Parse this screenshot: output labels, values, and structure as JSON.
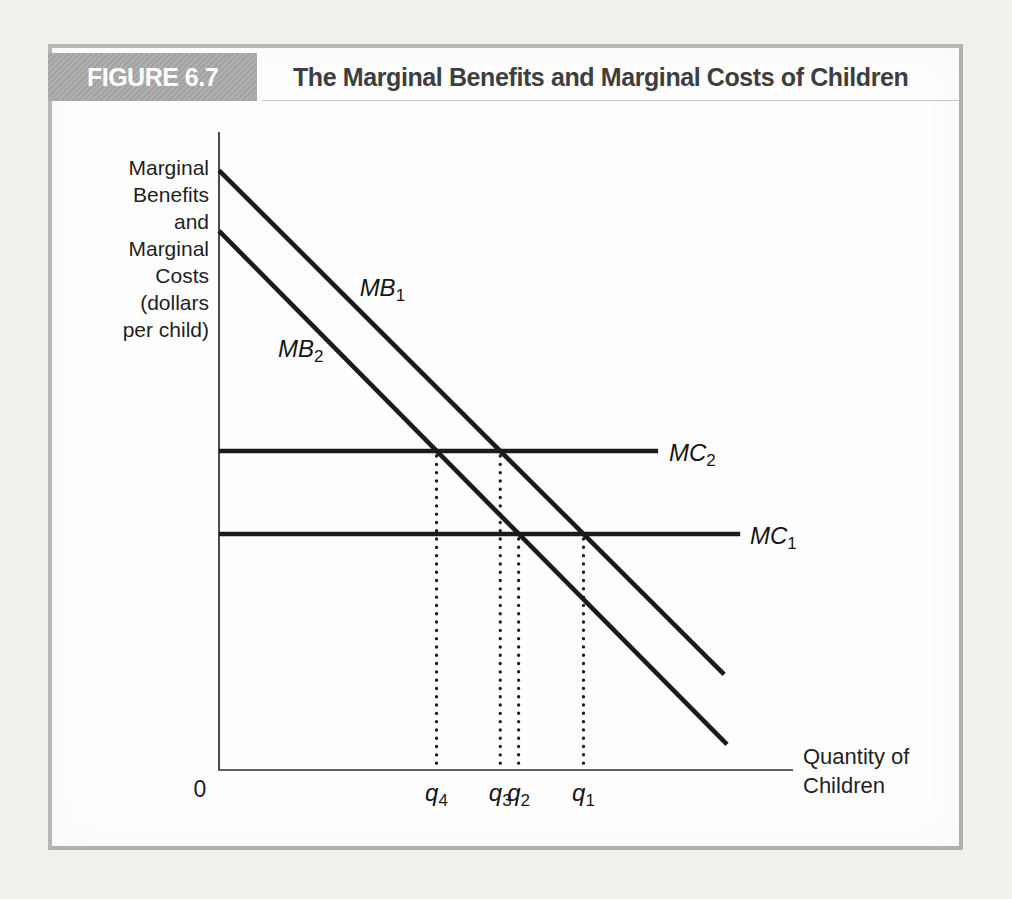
{
  "figure": {
    "tag": "FIGURE 6.7",
    "title": "The Marginal Benefits and Marginal Costs of Children",
    "tag_bg": "#a7a7a7",
    "tag_color": "#ffffff",
    "frame_border": "#b7b7b7"
  },
  "chart_data": {
    "type": "line",
    "title": "The Marginal Benefits and Marginal Costs of Children",
    "xlabel": "Quantity of Children",
    "ylabel": "Marginal Benefits and Marginal Costs (dollars per child)",
    "xlabel_lines": [
      "Quantity of",
      "Children"
    ],
    "ylabel_lines": [
      "Marginal",
      "Benefits",
      "and",
      "Marginal",
      "Costs",
      "(dollars",
      "per child)"
    ],
    "origin_label": "0",
    "xlim": [
      0,
      10
    ],
    "ylim": [
      0,
      10
    ],
    "grid": false,
    "axes_numeric": false,
    "line_color": "#1b1b1b",
    "axis_color": "#2b2b2b",
    "series": [
      {
        "name": "MB1",
        "label_main": "MB",
        "label_sub": "1",
        "points": [
          [
            0,
            9.4
          ],
          [
            8.8,
            1.5
          ]
        ],
        "label_at": [
          2.45,
          7.55
        ]
      },
      {
        "name": "MB2",
        "label_main": "MB",
        "label_sub": "2",
        "points": [
          [
            0,
            8.45
          ],
          [
            8.85,
            0.4
          ]
        ],
        "label_at": [
          1.03,
          6.6
        ]
      },
      {
        "name": "MC2",
        "label_main": "MC",
        "label_sub": "2",
        "points": [
          [
            0,
            5.0
          ],
          [
            7.65,
            5.0
          ]
        ],
        "label_at": [
          7.84,
          4.97
        ]
      },
      {
        "name": "MC1",
        "label_main": "MC",
        "label_sub": "1",
        "points": [
          [
            0,
            3.7
          ],
          [
            9.08,
            3.7
          ]
        ],
        "label_at": [
          9.25,
          3.67
        ]
      }
    ],
    "markers": [
      {
        "name": "q4",
        "label_main": "q",
        "label_sub": "4",
        "x": 3.79,
        "top_y": 5.0,
        "meaning": "MB2 = MC2"
      },
      {
        "name": "q3",
        "label_main": "q",
        "label_sub": "3",
        "x": 4.9,
        "top_y": 5.0,
        "meaning": "MB1 = MC2"
      },
      {
        "name": "q2",
        "label_main": "q",
        "label_sub": "2",
        "x": 5.22,
        "top_y": 3.7,
        "meaning": "MB2 = MC1"
      },
      {
        "name": "q1",
        "label_main": "q",
        "label_sub": "1",
        "x": 6.35,
        "top_y": 3.7,
        "meaning": "MB1 = MC1"
      }
    ]
  }
}
